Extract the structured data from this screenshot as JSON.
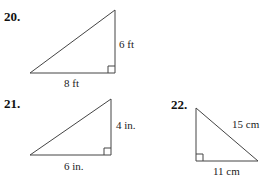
{
  "problems": [
    {
      "number": "20.",
      "legs": {
        "vertical": "6 ft",
        "horizontal": "8 ft"
      },
      "right_angle": "bottom-right"
    },
    {
      "number": "21.",
      "legs": {
        "vertical": "4 in.",
        "horizontal": "6 in."
      },
      "right_angle": "bottom-right"
    },
    {
      "number": "22.",
      "hypotenuse": "15 cm",
      "legs": {
        "horizontal": "11 cm"
      },
      "right_angle": "bottom-left"
    }
  ],
  "colors": {
    "line": "#444444",
    "text": "#222222"
  }
}
